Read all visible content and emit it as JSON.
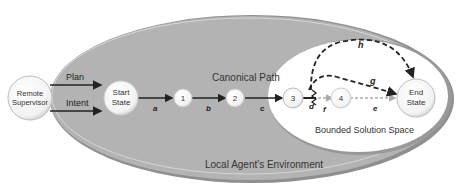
{
  "nodes": {
    "supervisor": {
      "line1": "Remote",
      "line2": "Supervisor"
    },
    "start": {
      "line1": "Start",
      "line2": "State"
    },
    "n1": "1",
    "n2": "2",
    "n3": "3",
    "n4": "4",
    "end": {
      "line1": "End",
      "line2": "State"
    }
  },
  "edges": {
    "plan": "Plan",
    "intent": "Intent",
    "a": "a",
    "b": "b",
    "c": "c",
    "d": "d",
    "e": "e",
    "f": "f",
    "g": "g",
    "h": "h"
  },
  "regions": {
    "canonical": "Canonical Path",
    "bounded": "Bounded Solution Space",
    "environment": "Local Agent's Environment"
  },
  "colors": {
    "environment_fill": "#b3b3b3",
    "environment_edge": "#8a8a8a",
    "node_fill": "#ffffff",
    "line": "#222222"
  }
}
